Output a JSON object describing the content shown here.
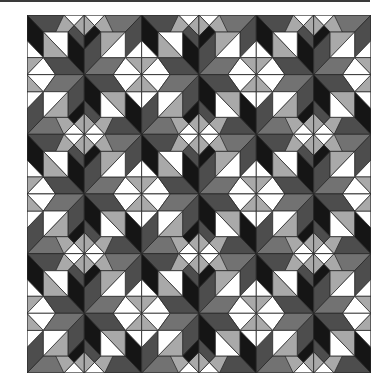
{
  "image": {
    "title": "Quilt pattern",
    "description": "3x3 repeating star quilt block pattern in grayscale",
    "grid": {
      "rows": 3,
      "cols": 3,
      "block_units": 14
    }
  },
  "palette": {
    "black": "#151515",
    "dark_gray": "#4d4d4d",
    "mid_gray": "#727272",
    "light_gray": "#a9a9a9",
    "white": "#ffffff",
    "outline": "#2a2a2a",
    "frame": "#3a3a3a"
  }
}
